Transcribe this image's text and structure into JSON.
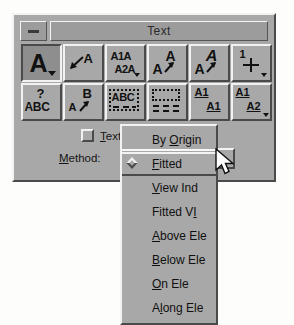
{
  "window": {
    "title": "Text",
    "minimize_label": "minimize",
    "bg_color": "#a8a8a8",
    "titlebar_color": "#9c9c9c"
  },
  "toolbar": {
    "rows": [
      [
        {
          "name": "place-text",
          "glyphs": [
            "A"
          ],
          "pressed": true,
          "caret": true
        },
        {
          "name": "place-note",
          "glyphs": [
            "A"
          ],
          "pressed": false,
          "caret": false
        },
        {
          "name": "edit-text",
          "glyphs": [
            "A1A",
            "A2A"
          ],
          "pressed": false,
          "caret": false
        },
        {
          "name": "match-text-attributes",
          "glyphs": [
            "A",
            "A"
          ],
          "pressed": false,
          "caret": false
        },
        {
          "name": "change-text-attributes",
          "glyphs": [
            "A",
            "A"
          ],
          "pressed": false,
          "caret": false
        },
        {
          "name": "display-text-attributes",
          "glyphs": [
            "1"
          ],
          "pressed": false,
          "caret": true
        }
      ],
      [
        {
          "name": "text-question",
          "glyphs": [
            "?",
            "ABC"
          ],
          "pressed": false,
          "caret": false
        },
        {
          "name": "copy-increment-text",
          "glyphs": [
            "B",
            "A"
          ],
          "pressed": false,
          "caret": false
        },
        {
          "name": "text-node-abc",
          "glyphs": [
            "ABC"
          ],
          "pressed": true,
          "caret": false
        },
        {
          "name": "empty-text-node",
          "glyphs": [],
          "pressed": false,
          "caret": false
        },
        {
          "name": "copy-enter-data-field",
          "glyphs": [
            "A1",
            "A1"
          ],
          "pressed": false,
          "caret": false
        },
        {
          "name": "increment-enter-data-field",
          "glyphs": [
            "A1",
            "A2"
          ],
          "pressed": false,
          "caret": true
        }
      ]
    ]
  },
  "controls": {
    "text_checkbox": {
      "label_before": "",
      "label_mnemonic": "T",
      "label_after": "ext",
      "checked": false
    },
    "method_label": {
      "mnemonic": "M",
      "rest": "ethod:"
    },
    "method_value": "Fitted"
  },
  "menu": {
    "items": [
      {
        "before": "By ",
        "mnemonic": "O",
        "after": "rigin",
        "selected": false,
        "header": true
      },
      {
        "before": "",
        "mnemonic": "F",
        "after": "itted",
        "selected": true,
        "header": false
      },
      {
        "before": "",
        "mnemonic": "V",
        "after": "iew Ind",
        "selected": false,
        "header": false
      },
      {
        "before": "Fitted V",
        "mnemonic": "I",
        "after": "",
        "selected": false,
        "header": false
      },
      {
        "before": "",
        "mnemonic": "A",
        "after": "bove Ele",
        "selected": false,
        "header": false
      },
      {
        "before": "",
        "mnemonic": "B",
        "after": "elow Ele",
        "selected": false,
        "header": false
      },
      {
        "before": "",
        "mnemonic": "O",
        "after": "n Ele",
        "selected": false,
        "header": false
      },
      {
        "before": "A",
        "mnemonic": "l",
        "after": "ong Ele",
        "selected": false,
        "header": false
      }
    ]
  },
  "cursor": {
    "name": "arrow-pointer"
  }
}
